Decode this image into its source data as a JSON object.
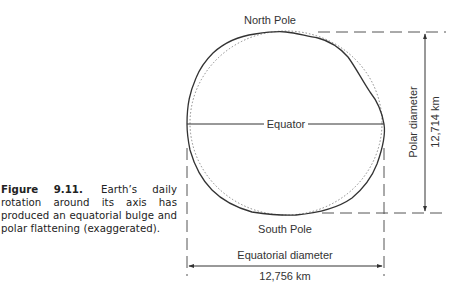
{
  "caption": {
    "figure_label": "Figure 9.11.",
    "text": "Earth’s daily rotation around its axis has produced an equatorial bulge and polar flattening (exaggerated)."
  },
  "diagram": {
    "labels": {
      "north_pole": "North Pole",
      "south_pole": "South Pole",
      "equator": "Equator",
      "polar_diameter": "Polar diameter",
      "polar_value": "12,714 km",
      "equatorial_diameter": "Equatorial diameter",
      "equatorial_value": "12,756 km"
    },
    "colors": {
      "line": "#333333",
      "dotted_circle": "#888888",
      "dashed": "#555555"
    }
  }
}
